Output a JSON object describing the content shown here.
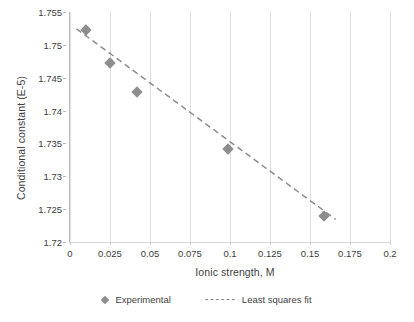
{
  "chart_data": {
    "type": "scatter",
    "title": "",
    "xlabel": "Ionic strength, M",
    "ylabel": "Conditional constant (E-5)",
    "xlim": [
      0,
      0.2
    ],
    "ylim": [
      1.72,
      1.755
    ],
    "grid": "vertical",
    "legend_position": "bottom",
    "x_ticks": [
      "0",
      "0.025",
      "0.05",
      "0.075",
      "0.1",
      "0.125",
      "0.15",
      "0.175",
      "0.2"
    ],
    "x_tick_values": [
      0,
      0.025,
      0.05,
      0.075,
      0.1,
      0.125,
      0.15,
      0.175,
      0.2
    ],
    "y_ticks": [
      "1.72",
      "1.725",
      "1.73",
      "1.735",
      "1.74",
      "1.745",
      "1.75",
      "1.755"
    ],
    "y_tick_values": [
      1.72,
      1.725,
      1.73,
      1.735,
      1.74,
      1.745,
      1.75,
      1.755
    ],
    "series": [
      {
        "name": "Experimental",
        "type": "scatter",
        "marker": "diamond",
        "color": "#8d8d8d",
        "x": [
          0.01,
          0.025,
          0.042,
          0.099,
          0.159
        ],
        "y": [
          1.7522,
          1.7472,
          1.7429,
          1.7341,
          1.7239
        ]
      },
      {
        "name": "Least squares fit",
        "type": "line",
        "style": "dashed",
        "color": "#8d8d8d",
        "x": [
          0.004,
          0.166
        ],
        "y": [
          1.75245,
          1.72345
        ]
      }
    ]
  },
  "axes": {
    "y_title": "Conditional constant (E-5)",
    "x_title": "Ionic strength, M"
  },
  "legend": {
    "items": [
      {
        "label": "Experimental",
        "glyph": "diamond-marker"
      },
      {
        "label": "Least squares fit",
        "glyph": "dashed-line"
      }
    ]
  },
  "colors": {
    "marker": "#8d8d8d",
    "fit_line": "#8d8d8d",
    "grid": "#e2e2e2",
    "axis": "#b9b9b9",
    "text": "#3f3f3f",
    "background": "#ffffff"
  }
}
